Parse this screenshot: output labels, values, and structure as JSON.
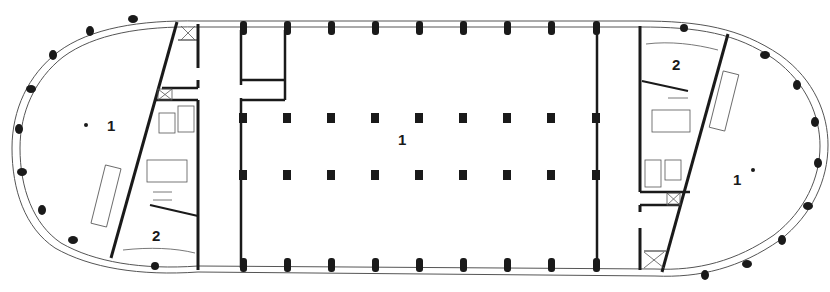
{
  "diagram": {
    "type": "architectural-floor-plan",
    "colors": {
      "wall": "#1a1a1a",
      "thin_line": "#555555",
      "background": "#ffffff"
    },
    "labels": [
      {
        "id": "left-lobe",
        "text": "1",
        "x": 107,
        "y": 118
      },
      {
        "id": "left-service",
        "text": "2",
        "x": 152,
        "y": 228
      },
      {
        "id": "central-hall",
        "text": "1",
        "x": 398,
        "y": 132
      },
      {
        "id": "right-service",
        "text": "2",
        "x": 672,
        "y": 57
      },
      {
        "id": "right-lobe",
        "text": "1",
        "x": 733,
        "y": 172
      }
    ],
    "grid": {
      "column_x": [
        243,
        287,
        331,
        375,
        419,
        463,
        507,
        551,
        596
      ],
      "interior_row_y": [
        118,
        175
      ],
      "perimeter_top_y": 28,
      "perimeter_bottom_y": 266
    }
  }
}
